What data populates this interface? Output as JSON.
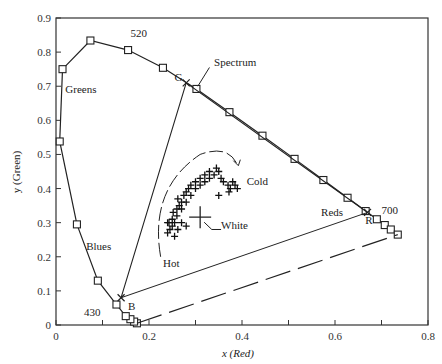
{
  "chart_data": {
    "type": "scatter",
    "title": "",
    "xlabel": "x (Red)",
    "ylabel": "y (Green)",
    "xlim": [
      0,
      0.8
    ],
    "ylim": [
      0,
      0.9
    ],
    "x_ticks": [
      0,
      0.1,
      0.2,
      0.3,
      0.4,
      0.5,
      0.6,
      0.7,
      0.8
    ],
    "x_tick_labels": [
      "0",
      "",
      "0.2",
      "",
      "0.4",
      "",
      "0.6",
      "",
      "0.8"
    ],
    "y_ticks": [
      0,
      0.1,
      0.2,
      0.3,
      0.4,
      0.5,
      0.6,
      0.7,
      0.8,
      0.9
    ],
    "y_tick_labels": [
      "0",
      "0.1",
      "0.2",
      "0.3",
      "0.4",
      "0.5",
      "0.6",
      "0.7",
      "0.8",
      "0.9"
    ],
    "grid": false,
    "series": [
      {
        "name": "Spectrum",
        "marker": "square",
        "points": [
          [
            0.174,
            0.005
          ],
          [
            0.168,
            0.01
          ],
          [
            0.16,
            0.017
          ],
          [
            0.15,
            0.026
          ],
          [
            0.13,
            0.06
          ],
          [
            0.09,
            0.13
          ],
          [
            0.045,
            0.295
          ],
          [
            0.008,
            0.538
          ],
          [
            0.014,
            0.75
          ],
          [
            0.074,
            0.834
          ],
          [
            0.155,
            0.806
          ],
          [
            0.23,
            0.754
          ],
          [
            0.302,
            0.692
          ],
          [
            0.373,
            0.624
          ],
          [
            0.444,
            0.555
          ],
          [
            0.513,
            0.487
          ],
          [
            0.575,
            0.425
          ],
          [
            0.627,
            0.373
          ],
          [
            0.666,
            0.334
          ],
          [
            0.69,
            0.31
          ],
          [
            0.707,
            0.293
          ],
          [
            0.72,
            0.28
          ],
          [
            0.735,
            0.265
          ]
        ]
      },
      {
        "name": "Primaries triangle",
        "marker": "x",
        "points": [
          {
            "label": "R",
            "x": 0.67,
            "y": 0.33
          },
          {
            "label": "G",
            "x": 0.28,
            "y": 0.71
          },
          {
            "label": "B",
            "x": 0.14,
            "y": 0.08
          }
        ]
      },
      {
        "name": "Samples",
        "marker": "plus",
        "points": [
          [
            0.24,
            0.27
          ],
          [
            0.245,
            0.28
          ],
          [
            0.25,
            0.29
          ],
          [
            0.243,
            0.3
          ],
          [
            0.25,
            0.31
          ],
          [
            0.255,
            0.3
          ],
          [
            0.26,
            0.32
          ],
          [
            0.252,
            0.33
          ],
          [
            0.26,
            0.34
          ],
          [
            0.265,
            0.35
          ],
          [
            0.27,
            0.36
          ],
          [
            0.262,
            0.37
          ],
          [
            0.275,
            0.38
          ],
          [
            0.28,
            0.39
          ],
          [
            0.285,
            0.4
          ],
          [
            0.29,
            0.41
          ],
          [
            0.3,
            0.42
          ],
          [
            0.31,
            0.43
          ],
          [
            0.32,
            0.44
          ],
          [
            0.33,
            0.45
          ],
          [
            0.34,
            0.44
          ],
          [
            0.35,
            0.45
          ],
          [
            0.355,
            0.43
          ],
          [
            0.36,
            0.42
          ],
          [
            0.37,
            0.41
          ],
          [
            0.375,
            0.4
          ],
          [
            0.38,
            0.42
          ],
          [
            0.385,
            0.41
          ],
          [
            0.39,
            0.4
          ],
          [
            0.372,
            0.39
          ],
          [
            0.345,
            0.46
          ],
          [
            0.33,
            0.43
          ],
          [
            0.31,
            0.41
          ],
          [
            0.3,
            0.4
          ],
          [
            0.29,
            0.38
          ],
          [
            0.28,
            0.36
          ],
          [
            0.27,
            0.34
          ],
          [
            0.255,
            0.26
          ],
          [
            0.262,
            0.28
          ],
          [
            0.27,
            0.3
          ],
          [
            0.28,
            0.29
          ],
          [
            0.24,
            0.3
          ],
          [
            0.35,
            0.38
          ],
          [
            0.32,
            0.42
          ]
        ]
      }
    ],
    "white_point": {
      "label": "White",
      "x": 0.31,
      "y": 0.316
    },
    "purple_line": [
      [
        0.174,
        0.005
      ],
      [
        0.735,
        0.265
      ]
    ],
    "annotations": [
      {
        "text": "520",
        "x": 0.16,
        "y": 0.845
      },
      {
        "text": "Spectrum",
        "x": 0.34,
        "y": 0.76
      },
      {
        "text": "Greens",
        "x": 0.02,
        "y": 0.68
      },
      {
        "text": "Blues",
        "x": 0.065,
        "y": 0.22
      },
      {
        "text": "Reds",
        "x": 0.57,
        "y": 0.32
      },
      {
        "text": "700",
        "x": 0.7,
        "y": 0.325
      },
      {
        "text": "430",
        "x": 0.06,
        "y": 0.025
      },
      {
        "text": "Cold",
        "x": 0.41,
        "y": 0.41
      },
      {
        "text": "Hot",
        "x": 0.23,
        "y": 0.17
      },
      {
        "text": "White",
        "x": 0.355,
        "y": 0.28
      },
      {
        "text": "G",
        "x": 0.255,
        "y": 0.715
      },
      {
        "text": "R",
        "x": 0.665,
        "y": 0.295
      },
      {
        "text": "B",
        "x": 0.155,
        "y": 0.045
      }
    ]
  }
}
